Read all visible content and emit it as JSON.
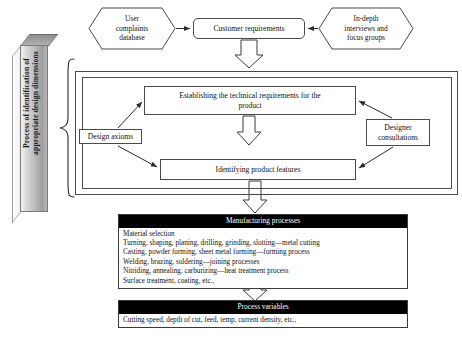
{
  "diagram": {
    "title": "Process of identification of appropriate design dimensions",
    "side_bar_label": "Process of identification of\nappropriate design dimensions",
    "inputs": {
      "left_source": "User\ncomplaints\ndatabase",
      "right_source": "In-depth\ninterviews and\nfocus groups"
    },
    "nodes": {
      "customer_requirements": "Customer requirements",
      "establishing_requirements": "Establishing the technical requirements for the\nproduct",
      "identifying_features": "Identifying product features",
      "design_axioms": "Design axioms",
      "designer_consultations": "Designer\nconsultations"
    },
    "manufacturing": {
      "header": "Manufacturing processes",
      "rows": [
        "Material selection",
        "Turning, shaping, planing, drilling, grinding, slotting—metal cutting",
        "Casting, powder forming, sheet metal forming—forming process",
        "Welding, brazing, soldering—joining processes",
        "Nitriding, annealing, carburizing—heat treatment process",
        "Surface treatment, coating, etc.,"
      ]
    },
    "process_variables": {
      "header": "Process variables",
      "rows": [
        "Cutting speed, depth of cut, feed, temp, current density, etc.,"
      ]
    },
    "colors": {
      "header_bg": "#000000",
      "header_text": "#ffffff",
      "stroke": "#4a4a4a",
      "bar_gradient_light": "#f2f2f2",
      "bar_gradient_dark": "#9e9e9e",
      "page_bg": "#ffffff"
    }
  }
}
